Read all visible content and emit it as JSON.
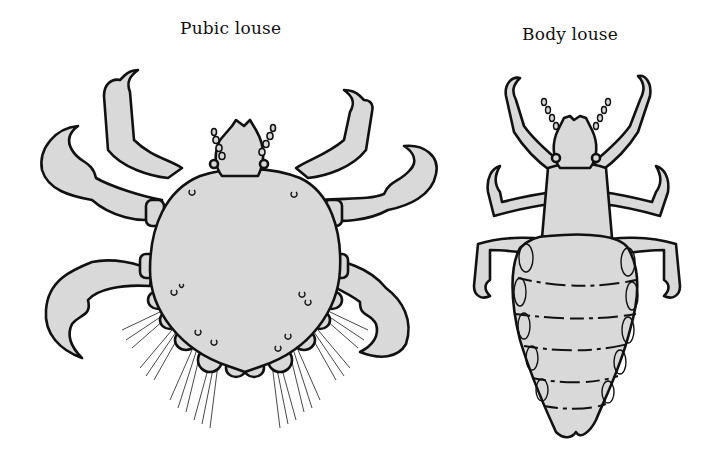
{
  "figure": {
    "type": "scientific-illustration",
    "panels": [
      {
        "id": "pubic",
        "label": "Pubic louse",
        "shape": "crab-like, broad heart-shaped body, large claws"
      },
      {
        "id": "body",
        "label": "Body louse",
        "shape": "elongated segmented abdomen, slender legs"
      }
    ],
    "colors": {
      "fill": "#d9d9d9",
      "outline": "#111111",
      "background": "#ffffff"
    }
  }
}
